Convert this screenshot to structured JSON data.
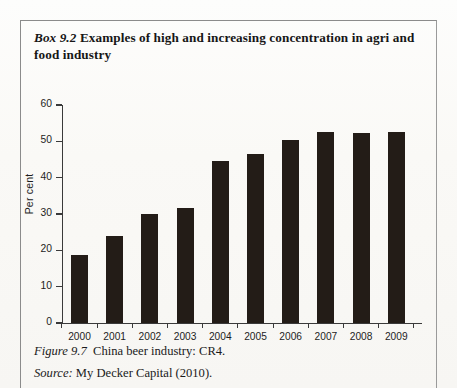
{
  "box": {
    "label": "Box 9.2",
    "title": "Examples of high and increasing concentration in agri and food industry"
  },
  "figure": {
    "label": "Figure 9.7",
    "caption": "China beer industry: CR4.",
    "source_label": "Source:",
    "source_text": "My Decker Capital (2010)."
  },
  "chart_data": {
    "type": "bar",
    "title": "China beer industry: CR4.",
    "xlabel": "",
    "ylabel": "Per cent",
    "categories": [
      "2000",
      "2001",
      "2002",
      "2003",
      "2004",
      "2005",
      "2006",
      "2007",
      "2008",
      "2009"
    ],
    "values": [
      18.6,
      24.0,
      30.0,
      31.6,
      44.6,
      46.4,
      50.4,
      52.6,
      52.2,
      52.5
    ],
    "ylim": [
      0,
      60
    ],
    "yticks": [
      0,
      10,
      20,
      30,
      40,
      50,
      60
    ],
    "ytick_labels": [
      "0",
      "10",
      "20",
      "30",
      "40",
      "50",
      "60"
    ],
    "grid": false,
    "legend": false,
    "bar_color": "#231c17",
    "axis_color": "#3a3a3a"
  }
}
